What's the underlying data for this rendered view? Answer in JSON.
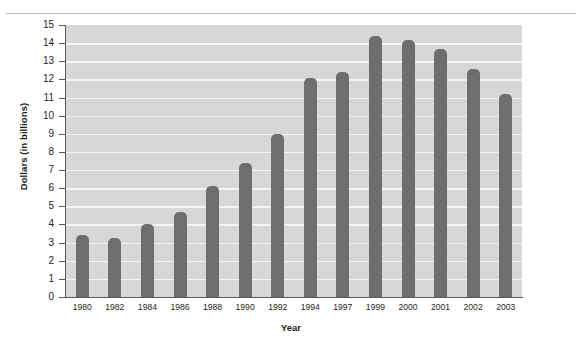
{
  "chart_data": {
    "type": "bar",
    "title": "",
    "xlabel": "Year",
    "ylabel": "Dollars (in billions)",
    "categories": [
      "1980",
      "1982",
      "1984",
      "1986",
      "1988",
      "1990",
      "1992",
      "1994",
      "1997",
      "1999",
      "2000",
      "2001",
      "2002",
      "2003"
    ],
    "values": [
      3.4,
      3.25,
      4.0,
      4.7,
      6.1,
      7.4,
      9.0,
      12.1,
      12.4,
      14.4,
      14.2,
      13.7,
      12.6,
      11.2
    ],
    "ylim": [
      0,
      15
    ],
    "yticks": [
      "0",
      "1",
      "2",
      "3",
      "4",
      "5",
      "6",
      "7",
      "8",
      "9",
      "10",
      "11",
      "12",
      "13",
      "14",
      "15"
    ],
    "grid": true,
    "legend": null,
    "series_name": "Dollars (in billions)",
    "colors": {
      "bar": "#6e6e6e",
      "plot_background": "#d7d7d7",
      "gridline": "#f4f4f4",
      "axis": "#58595b",
      "text": "#231f20",
      "page_background": "#ffffff",
      "top_rule": "#b9b9b9"
    }
  }
}
